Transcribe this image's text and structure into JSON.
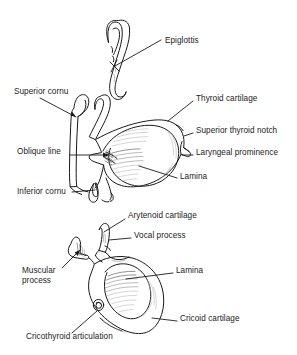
{
  "figure": {
    "background_color": "#ffffff",
    "line_color": "#1a1a1a",
    "hatch_color": "#8d8d8d",
    "width": 297,
    "height": 355
  },
  "panels": [
    {
      "id": "upper",
      "name": "thyroid-cartilage-panel",
      "description": "Thyroid cartilage with epiglottis, lateral view"
    },
    {
      "id": "lower",
      "name": "cricoid-cartilage-panel",
      "description": "Cricoid cartilage with arytenoid cartilage, lateral view"
    }
  ],
  "labels": [
    {
      "id": "epiglottis",
      "name": "label-epiglottis",
      "text": "Epiglottis",
      "panel": "upper",
      "x": 165,
      "y": 41,
      "align": "left"
    },
    {
      "id": "superior-cornu",
      "name": "label-superior-cornu",
      "text": "Superior cornu",
      "panel": "upper",
      "x": 14,
      "y": 92,
      "align": "left"
    },
    {
      "id": "thyroid-cartilage",
      "name": "label-thyroid-cartilage",
      "text": "Thyroid cartilage",
      "panel": "upper",
      "x": 196,
      "y": 99,
      "align": "left"
    },
    {
      "id": "superior-thyroid-notch",
      "name": "label-superior-thyroid-notch",
      "text": "Superior thyroid notch",
      "panel": "upper",
      "x": 196,
      "y": 131,
      "align": "left"
    },
    {
      "id": "oblique-line",
      "name": "label-oblique-line",
      "text": "Oblique line",
      "panel": "upper",
      "x": 17,
      "y": 152,
      "align": "left"
    },
    {
      "id": "laryngeal-prominence",
      "name": "label-laryngeal-prominence",
      "text": "Laryngeal prominence",
      "panel": "upper",
      "x": 196,
      "y": 153,
      "align": "left"
    },
    {
      "id": "lamina-thyroid",
      "name": "label-lamina-thyroid",
      "text": "Lamina",
      "panel": "upper",
      "x": 180,
      "y": 177,
      "align": "left"
    },
    {
      "id": "inferior-cornu",
      "name": "label-inferior-cornu",
      "text": "Inferior cornu",
      "panel": "upper",
      "x": 17,
      "y": 193,
      "align": "left"
    },
    {
      "id": "arytenoid-cartilage",
      "name": "label-arytenoid-cartilage",
      "text": "Arytenoid cartilage",
      "panel": "lower",
      "x": 128,
      "y": 216,
      "align": "left"
    },
    {
      "id": "vocal-process",
      "name": "label-vocal-process",
      "text": "Vocal process",
      "panel": "lower",
      "x": 134,
      "y": 236,
      "align": "left"
    },
    {
      "id": "muscular-process",
      "name": "label-muscular-process",
      "text": "Muscular\nprocess",
      "panel": "lower",
      "x": 22,
      "y": 271,
      "align": "left"
    },
    {
      "id": "lamina-cricoid",
      "name": "label-lamina-cricoid",
      "text": "Lamina",
      "panel": "lower",
      "x": 176,
      "y": 270,
      "align": "left"
    },
    {
      "id": "cricoid-cartilage",
      "name": "label-cricoid-cartilage",
      "text": "Cricoid cartilage",
      "panel": "lower",
      "x": 180,
      "y": 319,
      "align": "left"
    },
    {
      "id": "cricothyroid-articulation",
      "name": "label-cricothyroid-articulation",
      "text": "Cricothyroid articulation",
      "panel": "lower",
      "x": 26,
      "y": 337,
      "align": "left"
    }
  ]
}
